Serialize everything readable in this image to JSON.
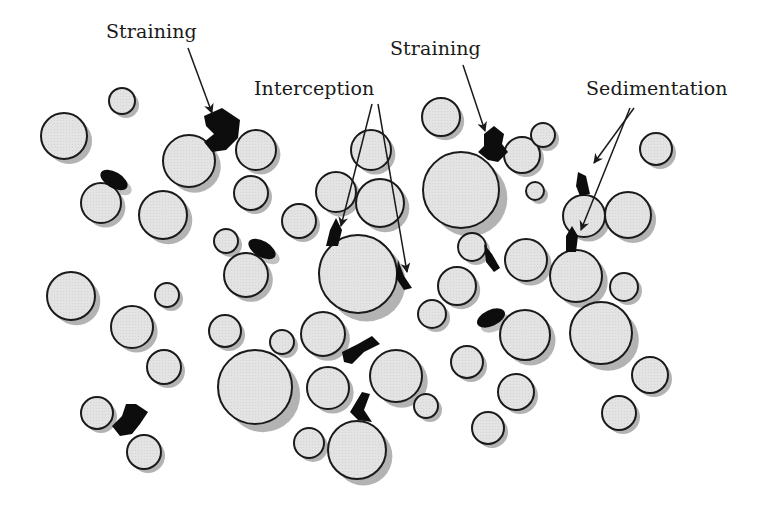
{
  "colors": {
    "background": "#ffffff",
    "grain_fill": "#e2e2e2",
    "grain_stroke": "#1a1a1a",
    "grain_shadow": "#9a9a9a",
    "particle": "#0d0d0d",
    "arrow": "#1a1a1a"
  },
  "labels": {
    "straining_left": "Straining",
    "interception": "Interception",
    "straining_right": "Straining",
    "sedimentation": "Sedimentation"
  },
  "grains": [
    {
      "cx": 64,
      "cy": 136,
      "r": 23
    },
    {
      "cx": 122,
      "cy": 101,
      "r": 13
    },
    {
      "cx": 101,
      "cy": 203,
      "r": 20
    },
    {
      "cx": 163,
      "cy": 215,
      "r": 24
    },
    {
      "cx": 189,
      "cy": 161,
      "r": 26
    },
    {
      "cx": 256,
      "cy": 150,
      "r": 20
    },
    {
      "cx": 251,
      "cy": 193,
      "r": 17
    },
    {
      "cx": 226,
      "cy": 241,
      "r": 12
    },
    {
      "cx": 246,
      "cy": 275,
      "r": 22
    },
    {
      "cx": 299,
      "cy": 221,
      "r": 17
    },
    {
      "cx": 371,
      "cy": 150,
      "r": 20
    },
    {
      "cx": 336,
      "cy": 192,
      "r": 20
    },
    {
      "cx": 380,
      "cy": 203,
      "r": 24
    },
    {
      "cx": 358,
      "cy": 274,
      "r": 39
    },
    {
      "cx": 441,
      "cy": 117,
      "r": 19
    },
    {
      "cx": 461,
      "cy": 190,
      "r": 38
    },
    {
      "cx": 522,
      "cy": 155,
      "r": 18
    },
    {
      "cx": 543,
      "cy": 135,
      "r": 12
    },
    {
      "cx": 535,
      "cy": 191,
      "r": 9
    },
    {
      "cx": 656,
      "cy": 149,
      "r": 16
    },
    {
      "cx": 584,
      "cy": 216,
      "r": 21
    },
    {
      "cx": 628,
      "cy": 215,
      "r": 23
    },
    {
      "cx": 472,
      "cy": 247,
      "r": 14
    },
    {
      "cx": 526,
      "cy": 260,
      "r": 21
    },
    {
      "cx": 576,
      "cy": 276,
      "r": 26
    },
    {
      "cx": 624,
      "cy": 287,
      "r": 14
    },
    {
      "cx": 457,
      "cy": 286,
      "r": 19
    },
    {
      "cx": 432,
      "cy": 314,
      "r": 14
    },
    {
      "cx": 71,
      "cy": 296,
      "r": 24
    },
    {
      "cx": 167,
      "cy": 295,
      "r": 12
    },
    {
      "cx": 132,
      "cy": 327,
      "r": 21
    },
    {
      "cx": 164,
      "cy": 367,
      "r": 17
    },
    {
      "cx": 225,
      "cy": 331,
      "r": 16
    },
    {
      "cx": 282,
      "cy": 342,
      "r": 12
    },
    {
      "cx": 323,
      "cy": 334,
      "r": 22
    },
    {
      "cx": 255,
      "cy": 387,
      "r": 37
    },
    {
      "cx": 328,
      "cy": 388,
      "r": 21
    },
    {
      "cx": 396,
      "cy": 376,
      "r": 26
    },
    {
      "cx": 426,
      "cy": 406,
      "r": 12
    },
    {
      "cx": 309,
      "cy": 443,
      "r": 15
    },
    {
      "cx": 357,
      "cy": 450,
      "r": 29
    },
    {
      "cx": 525,
      "cy": 335,
      "r": 25
    },
    {
      "cx": 601,
      "cy": 333,
      "r": 31
    },
    {
      "cx": 467,
      "cy": 362,
      "r": 16
    },
    {
      "cx": 516,
      "cy": 392,
      "r": 18
    },
    {
      "cx": 650,
      "cy": 375,
      "r": 18
    },
    {
      "cx": 488,
      "cy": 428,
      "r": 16
    },
    {
      "cx": 619,
      "cy": 413,
      "r": 17
    },
    {
      "cx": 97,
      "cy": 413,
      "r": 16
    },
    {
      "cx": 144,
      "cy": 452,
      "r": 17
    }
  ],
  "particles": [
    {
      "type": "blob",
      "points": "204,116 222,108 240,120 238,138 226,150 212,152 204,142 214,134 206,126",
      "name": "straining-particle-left"
    },
    {
      "type": "ellipse",
      "cx": 114,
      "cy": 180,
      "rx": 15,
      "ry": 8,
      "rot": 30,
      "name": "sediment-particle-1"
    },
    {
      "type": "ellipse",
      "cx": 262,
      "cy": 249,
      "rx": 15,
      "ry": 8,
      "rot": 30,
      "name": "sediment-particle-2"
    },
    {
      "type": "blob",
      "points": "484,134 494,126 504,134 502,144 508,152 498,162 488,160 478,152 484,146",
      "name": "straining-particle-right"
    },
    {
      "type": "blob",
      "points": "578,172 586,176 590,194 580,196 576,186",
      "name": "sedimentation-particle-top"
    },
    {
      "type": "blob",
      "points": "566,236 572,226 578,236 576,252 566,252",
      "name": "sedimentation-particle-bottom"
    },
    {
      "type": "blob",
      "points": "330,230 336,218 342,230 338,246 326,246",
      "name": "interception-particle-left"
    },
    {
      "type": "blob",
      "points": "398,260 404,276 412,288 404,290 396,278",
      "name": "interception-particle-right"
    },
    {
      "type": "blob",
      "points": "484,244 492,254 500,268 494,272 486,262",
      "name": "particle-small-mid"
    },
    {
      "type": "ellipse",
      "cx": 491,
      "cy": 318,
      "rx": 15,
      "ry": 8,
      "rot": -25,
      "name": "sediment-particle-3"
    },
    {
      "type": "blob",
      "points": "342,352 358,344 372,336 380,344 364,352 352,364 344,362",
      "name": "straining-particle-center"
    },
    {
      "type": "blob",
      "points": "350,412 362,392 370,394 364,410 372,422 358,420",
      "name": "straining-particle-center-low"
    },
    {
      "type": "blob",
      "points": "126,404 136,404 148,412 140,424 132,434 120,436 112,426 122,416",
      "name": "straining-particle-bottom-left"
    }
  ],
  "arrows": [
    {
      "x1": 188,
      "y1": 48,
      "x2": 212,
      "y2": 113,
      "name": "arrow-straining-left"
    },
    {
      "x1": 372,
      "y1": 104,
      "x2": 341,
      "y2": 226,
      "name": "arrow-interception-left"
    },
    {
      "x1": 378,
      "y1": 104,
      "x2": 407,
      "y2": 272,
      "name": "arrow-interception-right"
    },
    {
      "x1": 463,
      "y1": 65,
      "x2": 485,
      "y2": 131,
      "name": "arrow-straining-right"
    },
    {
      "x1": 634,
      "y1": 108,
      "x2": 594,
      "y2": 163,
      "name": "arrow-sedimentation-top"
    },
    {
      "x1": 630,
      "y1": 108,
      "x2": 581,
      "y2": 230,
      "name": "arrow-sedimentation-bottom"
    }
  ]
}
